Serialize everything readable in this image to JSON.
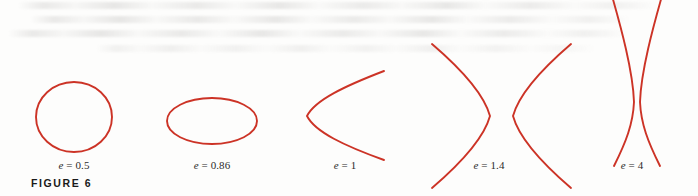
{
  "figure": {
    "caption": "FIGURE 6",
    "curve_color": "#cc3326",
    "background_color": "#fdfdfc",
    "text_color": "#2b2b2b",
    "width": 698,
    "height": 196
  },
  "chart_data": {
    "type": "line",
    "title": "FIGURE 6",
    "subtitle": "Conic sections of varying eccentricity",
    "xlabel": "",
    "ylabel": "",
    "grid": false,
    "legend": "none",
    "axes_shown": false,
    "annotations": [
      "e = 0.5",
      "e = 0.86",
      "e = 1",
      "e = 1.4",
      "e = 4"
    ],
    "series": [
      {
        "name": "e = 0.5",
        "eccentricity": 0.5,
        "conic_type": "ellipse",
        "shape_note": "nearly circular closed ellipse",
        "center": [
          74,
          117
        ],
        "semi_axes": [
          38,
          35
        ]
      },
      {
        "name": "e = 0.86",
        "eccentricity": 0.86,
        "conic_type": "ellipse",
        "shape_note": "flattened wide ellipse",
        "center": [
          212,
          121
        ],
        "semi_axes": [
          45,
          23
        ]
      },
      {
        "name": "e = 1",
        "eccentricity": 1,
        "conic_type": "parabola",
        "shape_note": "single branch opening to the right",
        "vertex": [
          307,
          116
        ],
        "opens": "right"
      },
      {
        "name": "e = 1.4",
        "eccentricity": 1.4,
        "conic_type": "hyperbola",
        "shape_note": "two branches, left branch opens left, right branch opens right",
        "left_vertex": [
          490,
          116
        ],
        "right_vertex": [
          513,
          116
        ]
      },
      {
        "name": "e = 4",
        "eccentricity": 4,
        "conic_type": "hyperbola",
        "shape_note": "two steep near-vertical branches crossing in an X",
        "left_vertex": [
          634,
          102
        ],
        "right_vertex": [
          640,
          102
        ]
      }
    ]
  },
  "labels": [
    {
      "id": "label-e-05",
      "var": "e",
      "eq": " = ",
      "value": "0.5",
      "text": "e = 0.5",
      "x": 74,
      "y": 165
    },
    {
      "id": "label-e-086",
      "var": "e",
      "eq": " = ",
      "value": "0.86",
      "text": "e = 0.86",
      "x": 212,
      "y": 165
    },
    {
      "id": "label-e-1",
      "var": "e",
      "eq": " = ",
      "value": "1",
      "text": "e = 1",
      "x": 345,
      "y": 165
    },
    {
      "id": "label-e-14",
      "var": "e",
      "eq": " = ",
      "value": "1.4",
      "text": "e = 1.4",
      "x": 489,
      "y": 165
    },
    {
      "id": "label-e-4",
      "var": "e",
      "eq": " = ",
      "value": "4",
      "text": "e = 4",
      "x": 632,
      "y": 165
    }
  ]
}
